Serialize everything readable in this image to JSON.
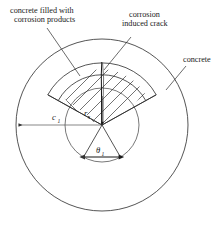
{
  "figure": {
    "title_text": "",
    "background_color": "#ffffff",
    "line_color": "#2a2a2a",
    "labels": {
      "corrosion_products": {
        "line1": "concrete filled with",
        "line2": "corrosion products",
        "name": "concrete-filled-with-corrosion-products-label"
      },
      "induced_crack": {
        "line1": "corrosion",
        "line2": "induced crack",
        "name": "corrosion-induced-crack-label"
      },
      "concrete": {
        "line1": "concrete",
        "name": "concrete-label"
      }
    },
    "dimensions": {
      "cover_thickness": {
        "symbol": "c",
        "subscript": "1",
        "description": "concrete cover radius"
      },
      "rebar_radius": {
        "symbol": "r",
        "subscript": "s",
        "description": "inner circle radius"
      },
      "wedge_angle": {
        "symbol": "θ",
        "subscript": "1",
        "description": "sector opening angle"
      }
    },
    "geometry": {
      "center_x": 102,
      "center_y": 125,
      "outer_radius": 86,
      "inner_radius": 37,
      "wedge_outer_radius": 62,
      "wedge_band_inner_radius": 50,
      "wedge_half_angle_deg": 29
    }
  }
}
